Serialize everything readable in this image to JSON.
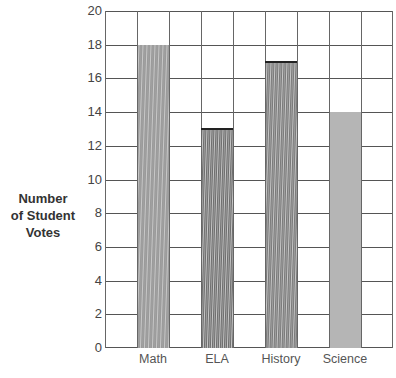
{
  "chart_data": {
    "type": "bar",
    "title": "",
    "xlabel": "",
    "ylabel": "Number of Student Votes",
    "ylabel_lines": [
      "Number",
      "of Student",
      "Votes"
    ],
    "categories": [
      "Math",
      "ELA",
      "History",
      "Science"
    ],
    "values": [
      18,
      13,
      17,
      14
    ],
    "ylim": [
      0,
      20
    ],
    "yticks": [
      "0",
      "2",
      "4",
      "6",
      "8",
      "10",
      "12",
      "14",
      "16",
      "18",
      "20"
    ],
    "grid": true,
    "legend": null,
    "style": "hand-shaded pencil bars on graph paper",
    "bar_colors": [
      "#9a9a9a",
      "#6e6e6e",
      "#7a7a7a",
      "#b5b5b5"
    ]
  }
}
